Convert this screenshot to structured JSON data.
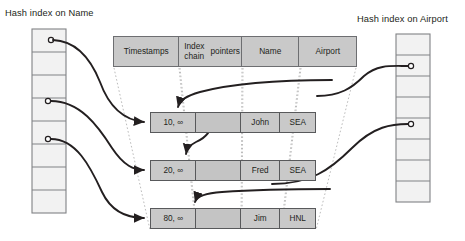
{
  "diagram": {
    "kind": "temporal-record-table-with-hash-indexes",
    "left_index": {
      "title": "Hash index on Name",
      "bucket_count": 8,
      "filled_buckets": [
        0,
        3,
        5
      ]
    },
    "right_index": {
      "title": "Hash index on Airport",
      "bucket_count": 8,
      "filled_buckets": [
        1,
        4
      ]
    },
    "legend": {
      "columns": [
        {
          "label": "Timestamps",
          "icon": "column-header"
        },
        {
          "label": "Index chain\npointers",
          "line1": "Index chain",
          "line2": "pointers"
        },
        {
          "label": "Name"
        },
        {
          "label": "Airport"
        }
      ]
    },
    "records": [
      {
        "timestamps": "10, ∞",
        "pointer": "filled",
        "name": "John",
        "airport": "SEA"
      },
      {
        "timestamps": "20, ∞",
        "pointer": "empty",
        "name": "Fred",
        "airport": "SEA"
      },
      {
        "timestamps": "80, ∞",
        "pointer": "empty",
        "name": "Jim",
        "airport": "HNL"
      }
    ],
    "colors": {
      "cell_fill": "#c9c9c9",
      "cell_stroke": "#58595b",
      "legend_stroke": "#6d6e71",
      "index_fill": "#f2f2f2",
      "index_stroke": "#808285",
      "arrow": "#231f20",
      "guide_dotted": "#bcbcbc",
      "text": "#231f20",
      "background": "#ffffff"
    }
  }
}
